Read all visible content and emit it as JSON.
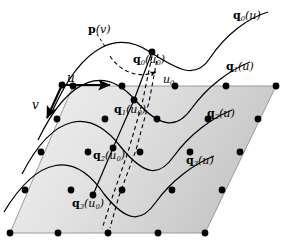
{
  "figure": {
    "type": "bezier-patch-diagram",
    "canvas": {
      "width": 285,
      "height": 249
    },
    "background": "#ffffff",
    "ink": "#000000"
  },
  "labels": {
    "p_v": {
      "base": "p",
      "arg": "(v)",
      "sub": "",
      "x": 88,
      "y": 24,
      "size": "s11"
    },
    "q0_u": {
      "base": "q",
      "arg": "(u)",
      "sub": "0",
      "x": 233,
      "y": 10,
      "size": "s11"
    },
    "q1_u": {
      "base": "q",
      "arg": "(u)",
      "sub": "1",
      "x": 226,
      "y": 61,
      "size": "s11"
    },
    "q2_u": {
      "base": "q",
      "arg": "(u)",
      "sub": "2",
      "x": 207,
      "y": 108,
      "size": "s11"
    },
    "q3_u": {
      "base": "q",
      "arg": "(u)",
      "sub": "3",
      "x": 186,
      "y": 155,
      "size": "s11"
    },
    "q0_u0": {
      "base": "q",
      "arg": "(u",
      "sub": "0",
      "x": 133,
      "y": 54,
      "size": "s11"
    },
    "q1_u0": {
      "base": "q",
      "arg": "(u",
      "sub": "1",
      "x": 114,
      "y": 104,
      "size": "s11"
    },
    "q2_u0": {
      "base": "q",
      "arg": "(u",
      "sub": "2",
      "x": 93,
      "y": 150,
      "size": "s11"
    },
    "q3_u0": {
      "base": "q",
      "arg": "(u",
      "sub": "3",
      "x": 72,
      "y": 198,
      "size": "s11"
    },
    "u_axis": {
      "text": "u",
      "x": 67,
      "y": 72,
      "size": "s12"
    },
    "v_axis": {
      "text": "v",
      "x": 32,
      "y": 99,
      "size": "s12"
    },
    "u0_param": {
      "text": "u",
      "sub": "0",
      "x": 163,
      "y": 74,
      "size": "s11"
    }
  },
  "geometry": {
    "parallelogram": {
      "name": "control-net-domain",
      "points": "73,86 276,86 205,233 10,233",
      "fill_light": "#eeeeee",
      "fill_dark": "#c9c9c9",
      "stroke": "#8a8a8a"
    },
    "control_points": {
      "radius": 3.4,
      "fill": "#000000",
      "rows": [
        [
          [
            73,
            86
          ],
          [
            122,
            86
          ],
          [
            175,
            86
          ],
          [
            226,
            86
          ],
          [
            276,
            86
          ]
        ],
        [
          [
            57,
            119
          ],
          [
            105,
            119
          ],
          [
            157,
            119
          ],
          [
            208,
            119
          ],
          [
            258,
            119
          ]
        ],
        [
          [
            41,
            152
          ],
          [
            88,
            152
          ],
          [
            140,
            152
          ],
          [
            190,
            152
          ],
          [
            240,
            152
          ]
        ],
        [
          [
            25,
            190
          ],
          [
            71,
            190
          ],
          [
            122,
            190
          ],
          [
            172,
            190
          ],
          [
            222,
            190
          ]
        ],
        [
          [
            10,
            233
          ],
          [
            58,
            233
          ],
          [
            108,
            233
          ],
          [
            158,
            233
          ],
          [
            205,
            233
          ]
        ]
      ]
    },
    "iso_curves": [
      {
        "name": "q0-curve",
        "d": "M 52,112 C 84,40 120,32 150,52 C 178,70 196,80 210,58 C 226,34 248,18 268,12"
      },
      {
        "name": "q1-curve",
        "d": "M 38,140 C 70,74 106,66 136,101 C 162,130 178,128 192,108 C 208,86 230,70 250,62"
      },
      {
        "name": "q2-curve",
        "d": "M 22,174 C 54,112 90,108 120,146 C 146,178 160,176 174,156 C 190,134 212,118 232,110"
      },
      {
        "name": "q3-curve",
        "d": "M 4,212 C 38,156 74,150 104,194 C 128,224 142,222 156,202 C 172,180 194,164 214,156"
      }
    ],
    "q0_chain": {
      "name": "u0-isoparam-line",
      "d": "M 152,52 L 134,100 L 113,148 L 93,195",
      "stroke": "#000000",
      "width": 1.3
    },
    "dashed_lines": [
      {
        "name": "u0-dashed-drop-right",
        "d": "M 158,54 L 149,102 L 136,150 L 119,196 L 110,228"
      },
      {
        "name": "u0-dashed-drop-left",
        "d": "M 152,56 L 142,104 L 128,152 L 112,198 L 102,229"
      }
    ],
    "pv_curve": {
      "name": "p-v-curve",
      "d": "M 97,34 L 106,48",
      "arc": "M 110,56 C 122,74 140,78 156,72"
    },
    "pv_arrow": {
      "x1": 150,
      "y1": 72,
      "x2": 163,
      "y2": 72
    },
    "u_arrow": {
      "x1": 62,
      "y1": 85,
      "x2": 110,
      "y2": 85
    },
    "v_arrow": {
      "x1": 62,
      "y1": 85,
      "x2": 47,
      "y2": 118
    },
    "origin_dot": {
      "x": 62,
      "y": 85,
      "r": 3.4
    },
    "eval_dots": [
      {
        "name": "q0-u0-dot",
        "x": 152,
        "y": 52
      },
      {
        "name": "q1-u0-dot",
        "x": 134,
        "y": 100
      },
      {
        "name": "q2-u0-dot",
        "x": 113,
        "y": 148
      },
      {
        "name": "q3-u0-dot",
        "x": 93,
        "y": 195
      }
    ]
  }
}
